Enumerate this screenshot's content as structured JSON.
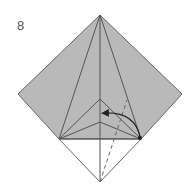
{
  "diagram": {
    "step_number": "8",
    "colors": {
      "paper_colored": "#b9b9b9",
      "paper_white": "#ffffff",
      "crease": "#555555",
      "edge": "#666666",
      "arrow": "#222222"
    },
    "arrow": {
      "type": "fold-arrow",
      "from": [
        140,
        137
      ],
      "to": [
        103,
        113
      ]
    },
    "dashed_line": {
      "type": "valley-fold-line",
      "from": [
        100,
        182
      ],
      "to": [
        127,
        100
      ]
    }
  }
}
